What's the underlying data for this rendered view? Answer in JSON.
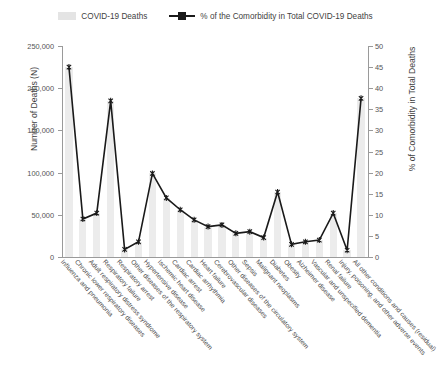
{
  "legend": {
    "bar_label": "COVID-19 Deaths",
    "line_label": "% of the Comorbidity in Total COVID-19 Deaths",
    "bar_icon": "bar-swatch-icon",
    "line_icon": "line-marker-swatch-icon"
  },
  "axes": {
    "left_title": "Number of Deaths (N)",
    "right_title": "% of Comorbidity in Total Deaths",
    "left_ticks": [
      "0",
      "50,000",
      "100,000",
      "150,000",
      "200,000",
      "250,000"
    ],
    "right_ticks": [
      "0",
      "5",
      "10",
      "15",
      "20",
      "25",
      "30",
      "35",
      "40",
      "45",
      "50"
    ]
  },
  "chart_data": {
    "type": "bar",
    "title": "",
    "xlabel": "",
    "ylabel": "Number of Deaths (N)",
    "y2label": "% of Comorbidity in Total Deaths",
    "ylim": [
      0,
      250000
    ],
    "y2lim": [
      0,
      50
    ],
    "grid": false,
    "legend_position": "top",
    "categories": [
      "Influenza and pneumonia",
      "Chronic lower respiratory diseases",
      "Adult respiratory distress syndrome",
      "Respiratory failure",
      "Respiratory arrest",
      "Other diseases of the respiratory system",
      "Hypertensive disease",
      "Ischemic heart disease",
      "Cardiac arrest",
      "Cardiac arrhythmia",
      "Heart failure",
      "Cerebrovascular diseases",
      "Other diseases of the circulatory system",
      "Sepsis",
      "Malignant neoplasms",
      "Diabetes",
      "Obesity",
      "Alzheimer disease",
      "Vascular and unspecified dementia",
      "Renal failure",
      "Injury, poisoning, and other adverse events",
      "All other conditions and causes (residual)"
    ],
    "series": [
      {
        "name": "COVID-19 Deaths",
        "axis": "left",
        "type": "bar",
        "values": [
          225000,
          45000,
          52000,
          185000,
          9000,
          18000,
          99000,
          70000,
          56000,
          44000,
          36000,
          38000,
          28000,
          30000,
          23000,
          77000,
          15000,
          18000,
          20000,
          52000,
          8000,
          188000
        ]
      },
      {
        "name": "% of the Comorbidity in Total COVID-19 Deaths",
        "axis": "right",
        "type": "line",
        "values": [
          45.0,
          9.0,
          10.4,
          37.0,
          1.8,
          3.6,
          19.8,
          14.0,
          11.2,
          8.8,
          7.2,
          7.6,
          5.6,
          6.0,
          4.6,
          15.4,
          3.0,
          3.6,
          4.0,
          10.4,
          1.6,
          37.6
        ]
      }
    ]
  }
}
